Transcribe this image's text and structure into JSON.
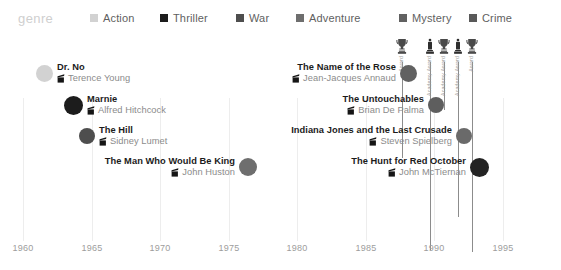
{
  "legend": {
    "title": "genre",
    "items": [
      {
        "label": "Action",
        "color": "#d2d2d2",
        "x": 90
      },
      {
        "label": "Thriller",
        "color": "#1c1c1c",
        "x": 160
      },
      {
        "label": "War",
        "color": "#4e4e4e",
        "x": 236
      },
      {
        "label": "Adventure",
        "color": "#6e6e6e",
        "x": 296
      },
      {
        "label": "Mystery",
        "color": "#616161",
        "x": 399
      },
      {
        "label": "Crime",
        "color": "#595959",
        "x": 469
      }
    ]
  },
  "chart_data": {
    "type": "scatter",
    "title": "",
    "xlabel": "",
    "ylabel": "",
    "xlim": [
      1958.5,
      1996.5
    ],
    "grid": true,
    "legend_position": "top",
    "x_ticks": [
      1960,
      1965,
      1970,
      1975,
      1980,
      1985,
      1990,
      1995
    ],
    "points": [
      {
        "title": "Dr. No",
        "director": "Terence Young",
        "year": 1962,
        "genre": "Action",
        "color": "#d2d2d2",
        "size": 17
      },
      {
        "title": "Marnie",
        "director": "Alfred Hitchcock",
        "year": 1964,
        "genre": "Thriller",
        "color": "#1c1c1c",
        "size": 19
      },
      {
        "title": "The Hill",
        "director": "Sidney Lumet",
        "year": 1965,
        "genre": "War",
        "color": "#4e4e4e",
        "size": 16
      },
      {
        "title": "The Man Who Would Be King",
        "director": "John Huston",
        "year": 1975,
        "genre": "Adventure",
        "color": "#6e6e6e",
        "size": 18
      },
      {
        "title": "The Name of the Rose",
        "director": "Jean-Jacques Annaud",
        "year": 1986,
        "genre": "Mystery",
        "color": "#616161",
        "size": 17
      },
      {
        "title": "The Untouchables",
        "director": "Brian De Palma",
        "year": 1987,
        "genre": "Crime",
        "color": "#5e5e5e",
        "size": 16
      },
      {
        "title": "Indiana Jones and the Last Crusade",
        "director": "Steven Spielberg",
        "year": 1989,
        "genre": "Adventure",
        "color": "#6a6a6a",
        "size": 16
      },
      {
        "title": "The Hunt for Red October",
        "director": "John McTiernan",
        "year": 1990,
        "genre": "Crime",
        "color": "#232323",
        "size": 19
      }
    ],
    "awards": [
      {
        "caption": "Award",
        "glyph": "trophy-cup",
        "year": 1986
      },
      {
        "caption": "Academy Award",
        "glyph": "oscar",
        "year": 1987
      },
      {
        "caption": "Academy Award",
        "glyph": "trophy-cup",
        "year": 1988
      },
      {
        "caption": "Academy Award",
        "glyph": "oscar",
        "year": 1989
      },
      {
        "caption": "Award",
        "glyph": "trophy-cup",
        "year": 1990
      }
    ]
  },
  "layout": {
    "films": [
      {
        "left": 36,
        "top": 20,
        "anchor": "left",
        "dot": 17
      },
      {
        "left": 64,
        "top": 52,
        "anchor": "left",
        "dot": 19
      },
      {
        "left": 79,
        "top": 83,
        "anchor": "left",
        "dot": 16
      },
      {
        "left": 239,
        "top": 114,
        "anchor": "right",
        "dot": 18
      },
      {
        "left": 400,
        "top": 20,
        "anchor": "right",
        "dot": 17
      },
      {
        "left": 428,
        "top": 52,
        "anchor": "right",
        "dot": 16
      },
      {
        "left": 456,
        "top": 83,
        "anchor": "right",
        "dot": 16
      },
      {
        "left": 470,
        "top": 114,
        "anchor": "right",
        "dot": 19
      }
    ],
    "gridlines": [
      23,
      92,
      160,
      229,
      297,
      366,
      434,
      503
    ],
    "awards_px": [
      402,
      430,
      444,
      458,
      472
    ],
    "award_stem_heights": [
      96,
      188,
      48,
      155,
      190
    ],
    "ticks_px": [
      23,
      92,
      160,
      229,
      297,
      366,
      434,
      503
    ]
  }
}
